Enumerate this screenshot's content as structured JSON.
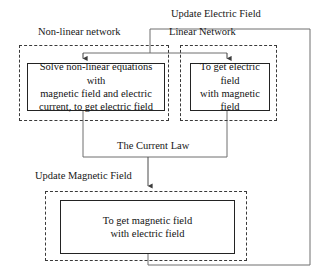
{
  "diagram": {
    "title_labels": {
      "update_electric_field": "Update Electric Field",
      "non_linear_network": "Non-linear network",
      "linear_network": "Linear Network",
      "the_current_law": "The Current Law",
      "update_magnetic_field": "Update Magnetic Field"
    },
    "process_boxes": {
      "solve_non_linear": "Solve non-linear equations with\nmagnetic field and electric\ncurrent, to get electric field",
      "get_electric_field": "To get electric field\nwith magnetic field",
      "get_magnetic_field": "To get magnetic field\nwith electric field"
    },
    "colors": {
      "box_stroke": "#232323",
      "group_stroke": "#3a3a3a",
      "wire_stroke": "#4a4a4a",
      "text": "#131313",
      "background": "#ffffff"
    }
  }
}
